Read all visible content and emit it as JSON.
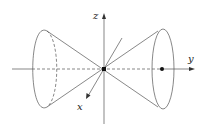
{
  "diagram": {
    "axes": {
      "x": {
        "label": "x"
      },
      "y": {
        "label": "y"
      },
      "z": {
        "label": "z"
      }
    },
    "colors": {
      "stroke": "#555555",
      "point": "#111111",
      "background": "#ffffff"
    }
  }
}
